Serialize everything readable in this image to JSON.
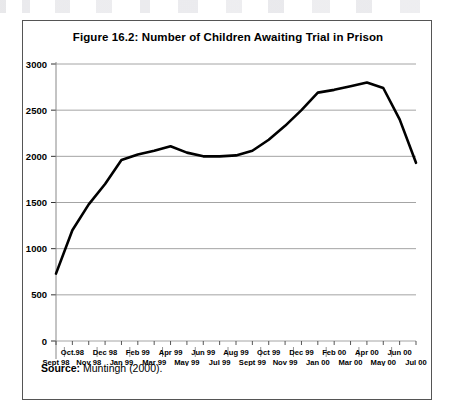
{
  "figure": {
    "title": "Figure 16.2: Number of Children Awaiting Trial in Prison",
    "source_label": "Source:",
    "source_text": "Muntingh (2000)."
  },
  "chart_data": {
    "type": "line",
    "title": "Figure 16.2: Number of Children Awaiting Trial in Prison",
    "xlabel": "",
    "ylabel": "",
    "ylim": [
      0,
      3000
    ],
    "yticks": [
      0,
      500,
      1000,
      1500,
      2000,
      2500,
      3000
    ],
    "ytick_labels": [
      "0",
      "500",
      "1000",
      "1500",
      "2000",
      "2500",
      "3000"
    ],
    "grid": true,
    "legend": "none",
    "categories": [
      "Sept 98",
      "Oct 98",
      "Nov 98",
      "Dec 98",
      "Jan 99",
      "Feb 99",
      "Mar 99",
      "Apr 99",
      "May 99",
      "Jun 99",
      "Jul 99",
      "Aug 99",
      "Sept 99",
      "Oct 99",
      "Nov 99",
      "Dec 99",
      "Jan 00",
      "Feb 00",
      "Mar 00",
      "Apr 00",
      "May 00",
      "Jun 00",
      "Jul 00"
    ],
    "xtick_labels_top": [
      "",
      "Oct.98",
      "",
      "Dec 98",
      "",
      "Feb 99",
      "",
      "Apr 99",
      "",
      "Jun 99",
      "",
      "Aug 99",
      "",
      "Oct 99",
      "",
      "Dec 99",
      "",
      "Feb 00",
      "",
      "Apr 00",
      "",
      "Jun 00",
      ""
    ],
    "xtick_labels_bottom": [
      "Sept 98",
      "",
      "Nov 98",
      "",
      "Jan 99",
      "",
      "Mar 99",
      "",
      "May 99",
      "",
      "Jul 99",
      "",
      "Sept 99",
      "",
      "Nov 99",
      "",
      "Jan 00",
      "",
      "Mar 00",
      "",
      "May 00",
      "",
      "Jul 00"
    ],
    "values": [
      730,
      1200,
      1480,
      1700,
      1960,
      2020,
      2060,
      2110,
      2040,
      2000,
      2000,
      2010,
      2060,
      2180,
      2330,
      2500,
      2690,
      2720,
      2760,
      2800,
      2740,
      2400,
      1930
    ],
    "series": [
      {
        "name": "Children awaiting trial",
        "color": "#000000",
        "values": [
          730,
          1200,
          1480,
          1700,
          1960,
          2020,
          2060,
          2110,
          2040,
          2000,
          2000,
          2010,
          2060,
          2180,
          2330,
          2500,
          2690,
          2720,
          2760,
          2800,
          2740,
          2400,
          1930
        ]
      }
    ]
  },
  "colors": {
    "line": "#000000",
    "grid": "#9a9a9a",
    "axis": "#888888",
    "border": "#555555"
  }
}
